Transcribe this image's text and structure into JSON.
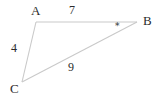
{
  "figure": {
    "type": "triangle-diagram",
    "background_color": "#ffffff",
    "line_color": "#c9c9c9",
    "text_color": "#2b2b2b",
    "vertices": [
      {
        "name": "A",
        "label": "A",
        "x": 36,
        "y": 22
      },
      {
        "name": "B",
        "label": "B",
        "x": 137,
        "y": 22
      },
      {
        "name": "C",
        "label": "C",
        "x": 22,
        "y": 82
      }
    ],
    "sides": [
      {
        "name": "AB",
        "label": "7",
        "from": "A",
        "to": "B"
      },
      {
        "name": "AC",
        "label": "4",
        "from": "A",
        "to": "C"
      },
      {
        "name": "CB",
        "label": "9",
        "from": "C",
        "to": "B"
      }
    ],
    "angle_marks": [
      {
        "at_vertex": "B",
        "glyph": "∗",
        "name": "asterisk-mark"
      }
    ]
  }
}
